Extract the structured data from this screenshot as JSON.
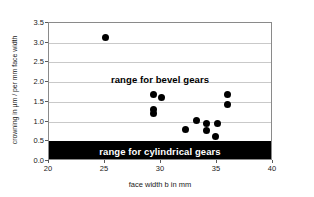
{
  "chart_data": {
    "type": "scatter",
    "title": "",
    "xlabel": "face width b in mm",
    "ylabel": "crowning in µm / per mm face width",
    "xlim": [
      20,
      40
    ],
    "ylim": [
      0.0,
      3.5
    ],
    "xticks": [
      "20",
      "25",
      "30",
      "35",
      "40"
    ],
    "yticks": [
      "0.0",
      "0.5",
      "1.0",
      "1.5",
      "2.0",
      "2.5",
      "3.0",
      "3.5"
    ],
    "grid": true,
    "legend": "none",
    "marker_color": "#000000",
    "series": [
      {
        "name": "measured gears",
        "points": [
          {
            "x": 25.0,
            "y": 3.12
          },
          {
            "x": 29.3,
            "y": 1.68
          },
          {
            "x": 30.0,
            "y": 1.6
          },
          {
            "x": 29.3,
            "y": 1.3
          },
          {
            "x": 29.3,
            "y": 1.21
          },
          {
            "x": 32.2,
            "y": 0.8
          },
          {
            "x": 33.2,
            "y": 1.02
          },
          {
            "x": 34.1,
            "y": 0.95
          },
          {
            "x": 34.1,
            "y": 0.78
          },
          {
            "x": 35.0,
            "y": 0.95
          },
          {
            "x": 34.9,
            "y": 0.62
          },
          {
            "x": 35.9,
            "y": 1.68
          },
          {
            "x": 35.9,
            "y": 1.44
          }
        ]
      }
    ],
    "annotations": [
      {
        "name": "range-for-bevel-gears",
        "text": "range for bevel gears",
        "y": 2.05,
        "style": "text"
      },
      {
        "name": "range-for-cylindrical-gears",
        "text": "range for cylindrical gears",
        "y_from": 0.0,
        "y_to": 0.5,
        "fill": "#000000",
        "text_color": "#ffffff",
        "style": "band"
      }
    ]
  }
}
